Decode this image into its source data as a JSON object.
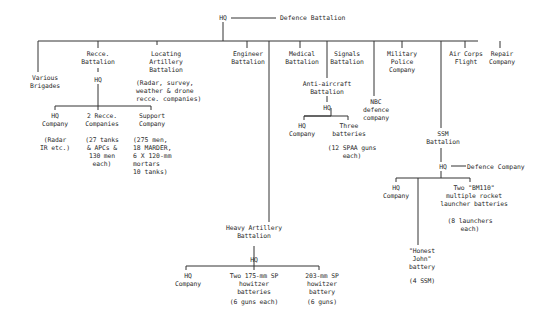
{
  "root": {
    "label": "HQ",
    "attached": "Defence Battalion"
  },
  "units": {
    "various_brigades": "Various\nBrigades",
    "recce_battalion": "Recce.\nBattalion",
    "recce_hq": "HQ",
    "recce_hq_company": "HQ\nCompany",
    "recce_hq_company_note": "(Radar\nIR etc.)",
    "recce_companies": "2 Recce.\nCompanies",
    "recce_companies_note": "(27 tanks\n& APCs &\n130 men\neach)",
    "support_company": "Support\nCompany",
    "support_company_note": "(275 men,\n18 MARDER,\n6 X 120-mm\nmortars\n10 tanks)",
    "locating_artillery": "Locating\nArtillery\nBattalion",
    "locating_artillery_note": "(Radar, survey,\nweather & drone\nrecce. companies)",
    "engineer_battalion": "Engineer\nBattalion",
    "heavy_artillery": "Heavy Artillery\nBattalion",
    "heavy_hq": "HQ",
    "heavy_hq_company": "HQ\nCompany",
    "heavy_175": "Two 175-mm SP\nhowitzer\nbatteries",
    "heavy_175_note": "(6 guns each)",
    "heavy_203": "203-mm SP\nhowitzer\nbattery",
    "heavy_203_note": "(6 guns)",
    "medical_battalion": "Medical\nBattalion",
    "signals_battalion": "Signals\nBattalion",
    "anti_aircraft": "Anti-aircraft\nBattalion",
    "aa_hq": "HQ",
    "aa_hq_company": "HQ\nCompany",
    "aa_batteries": "Three\nbatteries",
    "aa_batteries_note": "(12 SPAA guns\neach)",
    "nbc_company": "NBC\ndefence\ncompany",
    "military_police": "Military\nPolice\nCompany",
    "ssm_battalion": "SSM\nBattalion",
    "ssm_hq": "HQ",
    "ssm_defence": "Defence Company",
    "ssm_hq_company": "HQ\nCompany",
    "honest_john": "\"Honest\nJohn\"\nbattery",
    "honest_john_note": "(4 SSM)",
    "bm110": "Two \"BM110\"\nmultiple rocket\nlauncher batteries",
    "bm110_note": "(8 launchers\neach)",
    "air_corps": "Air Corps\nFlight",
    "repair_company": "Repair\nCompany"
  }
}
